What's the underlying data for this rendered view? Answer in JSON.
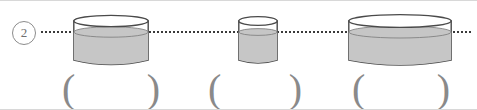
{
  "figure": {
    "question_number": "2",
    "background_color": "#ffffff",
    "level_line": {
      "style": "dotted",
      "color": "#3a3a3a",
      "label": "common-water-level"
    },
    "liquid_color": "#c6c6c6",
    "outline_color": "#4a4a4a",
    "containers": [
      {
        "name": "cylinder-wide-left",
        "left": 73,
        "top": 14,
        "width": 75,
        "height": 46,
        "ellipse_ry": 6,
        "fill_top_offset": 17,
        "answer": {
          "left_paren": "(",
          "right_paren": ")",
          "value": ""
        }
      },
      {
        "name": "cylinder-narrow-middle",
        "left": 238,
        "top": 15,
        "width": 38,
        "height": 45,
        "ellipse_ry": 5,
        "fill_top_offset": 16,
        "answer": {
          "left_paren": "(",
          "right_paren": ")",
          "value": ""
        }
      },
      {
        "name": "cylinder-widest-right",
        "left": 348,
        "top": 13,
        "width": 102,
        "height": 48,
        "ellipse_ry": 7,
        "fill_top_offset": 18,
        "answer": {
          "left_paren": "(",
          "right_paren": ")",
          "value": ""
        }
      }
    ]
  }
}
